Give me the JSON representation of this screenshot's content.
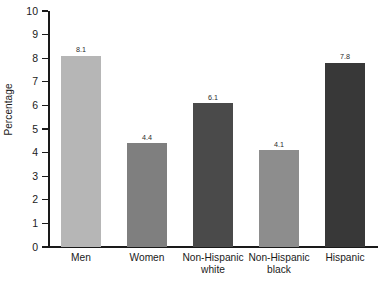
{
  "chart_data": {
    "type": "bar",
    "title": "",
    "xlabel": "",
    "ylabel": "Percentage",
    "categories": [
      "Men",
      "Women",
      "Non-Hispanic\nwhite",
      "Non-Hispanic\nblack",
      "Hispanic"
    ],
    "values": [
      8.1,
      4.4,
      6.1,
      4.1,
      7.8
    ],
    "value_labels": [
      "8.1",
      "4.4",
      "6.1",
      "4.1",
      "7.8"
    ],
    "bar_colors": [
      "#b6b6b6",
      "#7f7f7f",
      "#4a4a4a",
      "#8d8d8d",
      "#383838"
    ],
    "ylim": [
      0,
      10
    ],
    "ytick_labels": [
      "10",
      "9",
      "8",
      "7",
      "6",
      "5",
      "4",
      "3",
      "2",
      "1",
      "0"
    ],
    "ytick_values": [
      10,
      9,
      8,
      7,
      6,
      5,
      4,
      3,
      2,
      1,
      0
    ],
    "grid": false,
    "legend": null,
    "legend_position": "none",
    "axis_color": "#1a1a1a",
    "background": "#ffffff"
  }
}
